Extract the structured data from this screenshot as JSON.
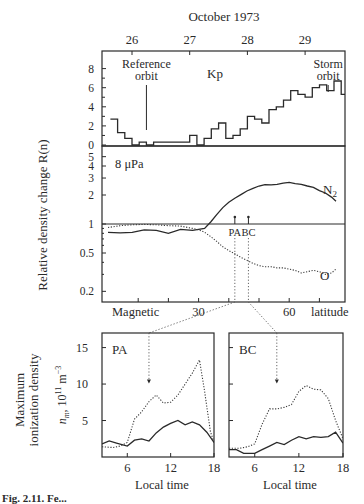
{
  "figure": {
    "top_title": "October 1973",
    "caption_fragment": "Fig. 2.11. Fe..."
  },
  "chart_data": [
    {
      "id": "kp_panel",
      "type": "line",
      "subtype": "step",
      "title": "Kp",
      "xlabel": "October 1973",
      "x_ticks": [
        "26",
        "27",
        "28",
        "29"
      ],
      "ylabel": "",
      "y_ticks": [
        "0",
        "2",
        "4",
        "6",
        "8"
      ],
      "ylim": [
        0,
        9
      ],
      "annotations": [
        {
          "text_line1": "Reference",
          "text_line2": "orbit",
          "x_day": 26.25
        },
        {
          "text_line1": "Storm",
          "text_line2": "orbit",
          "x_day": 29.4
        }
      ],
      "series": [
        {
          "name": "Kp",
          "x_days_start": 25.625,
          "step_days": 0.125,
          "values": [
            2.7,
            1.3,
            0.7,
            0.0,
            0.3,
            0.0,
            0.3,
            0.3,
            0.3,
            0.3,
            0.3,
            1.0,
            0.0,
            0.7,
            1.7,
            2.3,
            0.7,
            1.0,
            1.7,
            3.0,
            2.7,
            2.3,
            3.7,
            4.0,
            4.7,
            5.7,
            5.3,
            5.0,
            6.0,
            6.3,
            5.7,
            6.7,
            5.3
          ]
        }
      ]
    },
    {
      "id": "density_panel",
      "type": "line",
      "title": "8 μPa",
      "xlabel": "Magnetic latitude",
      "x_ticks": [
        "30",
        "60"
      ],
      "x_tick_positions_deg": [
        30,
        60
      ],
      "xlim_deg": [
        0,
        80
      ],
      "ylabel": "Relative density change R(n)",
      "y_scale": "log",
      "y_ticks": [
        "0.2",
        "0.5",
        "1",
        "2",
        "3",
        "4",
        "5"
      ],
      "ylim": [
        0.15,
        6
      ],
      "markers": [
        {
          "label": "PA",
          "x_deg": 42
        },
        {
          "label": "BC",
          "x_deg": 46.5
        }
      ],
      "series": [
        {
          "name": "N2",
          "style": "solid",
          "x_deg": [
            0,
            4,
            8,
            12,
            16,
            20,
            24,
            28,
            30,
            32,
            34,
            36,
            38,
            40,
            42,
            44,
            46,
            48,
            50,
            52,
            54,
            56,
            58,
            60,
            62,
            64,
            66,
            68,
            70,
            72,
            74,
            75.5
          ],
          "values": [
            0.82,
            0.81,
            0.82,
            0.87,
            0.86,
            0.8,
            0.88,
            0.86,
            0.88,
            0.9,
            1.05,
            1.25,
            1.48,
            1.68,
            1.85,
            2.02,
            2.2,
            2.35,
            2.48,
            2.56,
            2.55,
            2.58,
            2.65,
            2.7,
            2.62,
            2.58,
            2.48,
            2.4,
            2.22,
            2.1,
            1.9,
            1.72
          ]
        },
        {
          "name": "O",
          "style": "dotted",
          "x_deg": [
            0,
            4,
            8,
            12,
            16,
            20,
            24,
            28,
            30,
            32,
            34,
            36,
            38,
            40,
            42,
            44,
            46,
            48,
            50,
            52,
            54,
            56,
            58,
            60,
            62,
            64,
            66,
            68,
            70,
            72,
            74,
            75.5
          ],
          "values": [
            0.92,
            0.96,
            0.98,
            0.99,
            0.98,
            0.96,
            0.95,
            0.9,
            0.87,
            0.82,
            0.74,
            0.66,
            0.58,
            0.53,
            0.49,
            0.45,
            0.42,
            0.39,
            0.37,
            0.36,
            0.36,
            0.35,
            0.35,
            0.34,
            0.33,
            0.31,
            0.32,
            0.33,
            0.32,
            0.3,
            0.31,
            0.34
          ]
        }
      ],
      "labels": {
        "n2": "N",
        "n2_sub": "2",
        "o": "O",
        "x_left": "Magnetic",
        "x_right": "latitude"
      }
    },
    {
      "id": "pa_panel",
      "type": "line",
      "title": "PA",
      "xlabel": "Local time",
      "x_ticks": [
        "6",
        "12",
        "18"
      ],
      "xlim": [
        2.5,
        18
      ],
      "ylabel": "Maximum ionization density",
      "ylabel2": "n_m, 10^11 m^-3",
      "y_ticks": [
        "5",
        "10",
        "15"
      ],
      "ylim": [
        0,
        17
      ],
      "arrow_time": 9,
      "series": [
        {
          "name": "storm",
          "style": "dotted",
          "x": [
            2.5,
            4,
            5,
            6,
            7,
            8,
            9,
            10,
            11,
            12,
            13,
            14,
            15,
            16,
            16.7,
            17.5,
            18
          ],
          "values": [
            1.4,
            1.3,
            1.5,
            2.0,
            5.2,
            6.2,
            7.6,
            8.5,
            7.4,
            7.5,
            8.5,
            10.0,
            11.5,
            13.3,
            9.0,
            3.5,
            2.0
          ]
        },
        {
          "name": "reference",
          "style": "solid",
          "x": [
            2.5,
            3.5,
            4.5,
            6,
            7,
            8,
            9,
            10,
            11,
            12,
            13,
            14,
            15,
            16,
            17,
            18
          ],
          "values": [
            1.8,
            2.2,
            1.9,
            1.5,
            2.3,
            2.5,
            2.2,
            3.3,
            4.1,
            4.6,
            5.0,
            4.4,
            4.8,
            4.4,
            3.4,
            2.0
          ]
        }
      ]
    },
    {
      "id": "bc_panel",
      "type": "line",
      "title": "BC",
      "xlabel": "Local time",
      "x_ticks": [
        "6",
        "12",
        "18"
      ],
      "xlim": [
        2.5,
        18
      ],
      "y_ticks": [
        "5",
        "10",
        "15"
      ],
      "ylim": [
        0,
        17
      ],
      "arrow_time": 9,
      "series": [
        {
          "name": "storm",
          "style": "dotted",
          "x": [
            2.5,
            4,
            5,
            6,
            7,
            8,
            9,
            10,
            11,
            12,
            13,
            14,
            15,
            16,
            17,
            18
          ],
          "values": [
            1.2,
            1.2,
            1.4,
            1.8,
            4.5,
            6.6,
            6.6,
            6.8,
            7.2,
            9.0,
            9.8,
            9.3,
            9.2,
            8.0,
            5.0,
            2.5
          ]
        },
        {
          "name": "reference",
          "style": "solid",
          "x": [
            2.5,
            3.5,
            4.5,
            6,
            7,
            8,
            9,
            10,
            11,
            12,
            13,
            14,
            15,
            16,
            17,
            18
          ],
          "values": [
            1.0,
            1.0,
            0.5,
            0.5,
            1.0,
            1.5,
            2.0,
            1.7,
            2.3,
            2.8,
            2.5,
            2.8,
            2.7,
            2.8,
            3.4,
            1.9
          ]
        }
      ]
    }
  ]
}
